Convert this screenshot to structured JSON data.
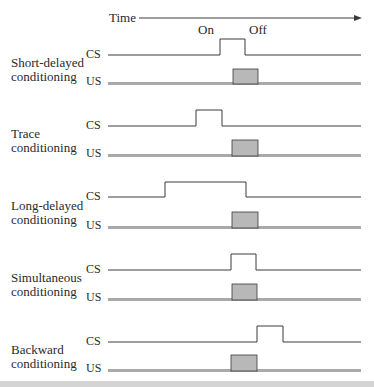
{
  "diagram": {
    "time_label": "Time",
    "on_label": "On",
    "off_label": "Off",
    "cs_label": "CS",
    "us_label": "US",
    "colors": {
      "line": "#3a3a3a",
      "us_fill": "#b8b8b8",
      "us_base": "#a9a9a9"
    },
    "rows": [
      {
        "name": "short-delayed",
        "title1": "Short-delayed",
        "title2": "conditioning",
        "cs": {
          "baseline": 55,
          "top": 39,
          "start": 220,
          "end": 245
        },
        "us": {
          "baseline": 84,
          "top": 69,
          "start": 233,
          "end": 258
        }
      },
      {
        "name": "trace",
        "title1": "Trace",
        "title2": "conditioning",
        "cs": {
          "baseline": 126,
          "top": 110,
          "start": 196,
          "end": 222
        },
        "us": {
          "baseline": 156,
          "top": 140,
          "start": 232,
          "end": 258
        }
      },
      {
        "name": "long-delayed",
        "title1": "Long-delayed",
        "title2": "conditioning",
        "cs": {
          "baseline": 197,
          "top": 182,
          "start": 165,
          "end": 246
        },
        "us": {
          "baseline": 228,
          "top": 212,
          "start": 232,
          "end": 258
        }
      },
      {
        "name": "simultaneous",
        "title1": "Simultaneous",
        "title2": "conditioning",
        "cs": {
          "baseline": 270,
          "top": 254,
          "start": 231,
          "end": 256
        },
        "us": {
          "baseline": 300,
          "top": 284,
          "start": 232,
          "end": 257
        }
      },
      {
        "name": "backward",
        "title1": "Backward",
        "title2": "conditioning",
        "cs": {
          "baseline": 342,
          "top": 326,
          "start": 257,
          "end": 283
        },
        "us": {
          "baseline": 371,
          "top": 355,
          "start": 231,
          "end": 257
        }
      }
    ]
  }
}
